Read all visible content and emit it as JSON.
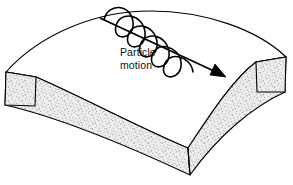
{
  "figure": {
    "kind": "technical-line-diagram",
    "background_color": "#ffffff",
    "width": 293,
    "height": 185
  },
  "annotation": {
    "label_lines": [
      "Particle",
      "motion"
    ],
    "line1": "Particle",
    "line2": "motion",
    "text_color": "#111111",
    "font_size_px": 10.5
  },
  "arrow": {
    "name": "particle-motion-arrow",
    "direction": "down-right",
    "start": {
      "x": 100,
      "y": 18
    },
    "end": {
      "x": 225,
      "y": 77
    },
    "stroke_color": "#000000",
    "stroke_width": 1.8,
    "head_style": "solid-filled-triangle",
    "head_length": 13,
    "head_width": 8
  },
  "wave": {
    "name": "helical-particle-wave",
    "shape": "helix-coiled-around-arrow",
    "turns": 3,
    "amplitude_px": 22,
    "stroke_color": "#000000",
    "stroke_width": 1.6,
    "fill": "none"
  },
  "plate": {
    "name": "curved-plate",
    "top_surface_color": "#ffffff",
    "edge_color": "#000000",
    "edge_width": 1.1,
    "side_face_fill": "#e8e8e8",
    "side_face_texture": "stipple-speckle",
    "stipple_color": "#4a4a4a",
    "stipple_count": 2600,
    "vertices": {
      "top_left": {
        "x": 6,
        "y": 72
      },
      "top_apex": {
        "x": 150,
        "y": 11
      },
      "top_right": {
        "x": 286,
        "y": 57
      },
      "bottom_left_outer": {
        "x": 5,
        "y": 105
      },
      "bottom_v_point": {
        "x": 190,
        "y": 175
      },
      "bottom_right_outer": {
        "x": 285,
        "y": 92
      },
      "front_left_inner": {
        "x": 36,
        "y": 77
      },
      "front_right_inner": {
        "x": 256,
        "y": 62
      },
      "v_point_inner": {
        "x": 188,
        "y": 148
      }
    }
  },
  "colors": {
    "ink": "#000000",
    "stipple": "#4a4a4a",
    "paper": "#ffffff",
    "side_face": "#e8e8e8"
  }
}
